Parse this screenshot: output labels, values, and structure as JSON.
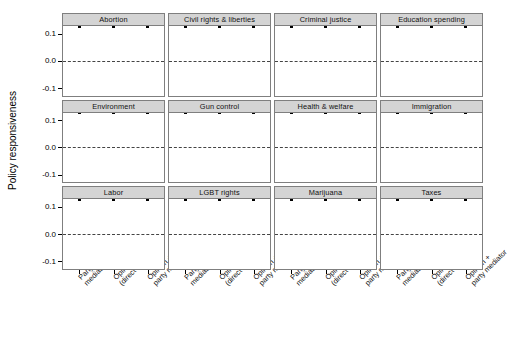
{
  "chart_data": {
    "type": "scatter",
    "title": "",
    "xlabel": "",
    "ylabel": "Policy responsiveness",
    "ylim": [
      -0.13,
      0.13
    ],
    "yticks": [
      "0.1",
      "0.0",
      "-0.1"
    ],
    "ytick_values": [
      0.1,
      0.0,
      -0.1
    ],
    "grid": false,
    "legend": "none",
    "reference_line": 0.0,
    "facet_layout": {
      "rows": 3,
      "cols": 4
    },
    "categories": [
      "Party mediator",
      "Opinion (direct effect)",
      "Opinion + party mediator"
    ],
    "xtick_labels": [
      [
        "Party",
        "mediator"
      ],
      [
        "Opinion",
        "(direct effect)"
      ],
      [
        "Opinion +",
        "party mediator"
      ]
    ],
    "panels": [
      {
        "title": "Abortion",
        "points": [
          {
            "x": "Party mediator",
            "estimate": 0.001,
            "low": 0.0,
            "high": 0.002
          },
          {
            "x": "Opinion (direct effect)",
            "estimate": 0.019,
            "low": 0.01,
            "high": 0.028
          },
          {
            "x": "Opinion + party mediator",
            "estimate": 0.018,
            "low": 0.009,
            "high": 0.027
          }
        ]
      },
      {
        "title": "Civil rights & liberties",
        "points": [
          {
            "x": "Party mediator",
            "estimate": 0.0,
            "low": -0.001,
            "high": 0.001
          },
          {
            "x": "Opinion (direct effect)",
            "estimate": -0.018,
            "low": -0.027,
            "high": -0.009
          },
          {
            "x": "Opinion + party mediator",
            "estimate": -0.018,
            "low": -0.027,
            "high": -0.009
          }
        ]
      },
      {
        "title": "Criminal justice",
        "points": [
          {
            "x": "Party mediator",
            "estimate": 0.0,
            "low": -0.001,
            "high": 0.001
          },
          {
            "x": "Opinion (direct effect)",
            "estimate": 0.0,
            "low": -0.021,
            "high": 0.021
          },
          {
            "x": "Opinion + party mediator",
            "estimate": 0.0,
            "low": -0.02,
            "high": 0.02
          }
        ]
      },
      {
        "title": "Education spending",
        "points": [
          {
            "x": "Party mediator",
            "estimate": 0.002,
            "low": 0.001,
            "high": 0.003
          },
          {
            "x": "Opinion (direct effect)",
            "estimate": -0.005,
            "low": -0.014,
            "high": 0.004
          },
          {
            "x": "Opinion + party mediator",
            "estimate": -0.003,
            "low": -0.012,
            "high": 0.006
          }
        ]
      },
      {
        "title": "Environment",
        "points": [
          {
            "x": "Party mediator",
            "estimate": 0.001,
            "low": 0.0,
            "high": 0.002
          },
          {
            "x": "Opinion (direct effect)",
            "estimate": 0.001,
            "low": -0.013,
            "high": 0.015
          },
          {
            "x": "Opinion + party mediator",
            "estimate": 0.003,
            "low": -0.011,
            "high": 0.017
          }
        ]
      },
      {
        "title": "Gun control",
        "points": [
          {
            "x": "Party mediator",
            "estimate": 0.0,
            "low": -0.001,
            "high": 0.001
          },
          {
            "x": "Opinion (direct effect)",
            "estimate": 0.002,
            "low": -0.003,
            "high": 0.007
          },
          {
            "x": "Opinion + party mediator",
            "estimate": 0.003,
            "low": -0.002,
            "high": 0.008
          }
        ]
      },
      {
        "title": "Health & welfare",
        "points": [
          {
            "x": "Party mediator",
            "estimate": 0.002,
            "low": 0.001,
            "high": 0.003
          },
          {
            "x": "Opinion (direct effect)",
            "estimate": -0.03,
            "low": -0.052,
            "high": 0.006
          },
          {
            "x": "Opinion + party mediator",
            "estimate": -0.029,
            "low": -0.05,
            "high": 0.006
          }
        ]
      },
      {
        "title": "Immigration",
        "points": [
          {
            "x": "Party mediator",
            "estimate": -0.014,
            "low": -0.029,
            "high": 0.004
          },
          {
            "x": "Opinion (direct effect)",
            "estimate": -0.035,
            "low": -0.065,
            "high": 0.007
          },
          {
            "x": "Opinion + party mediator",
            "estimate": -0.055,
            "low": -0.085,
            "high": 0.003
          }
        ]
      },
      {
        "title": "Labor",
        "points": [
          {
            "x": "Party mediator",
            "estimate": 0.0,
            "low": -0.001,
            "high": 0.001
          },
          {
            "x": "Opinion (direct effect)",
            "estimate": 0.002,
            "low": -0.013,
            "high": 0.017
          },
          {
            "x": "Opinion + party mediator",
            "estimate": 0.005,
            "low": -0.011,
            "high": 0.02
          }
        ]
      },
      {
        "title": "LGBT rights",
        "points": [
          {
            "x": "Party mediator",
            "estimate": 0.0,
            "low": -0.001,
            "high": 0.001
          },
          {
            "x": "Opinion (direct effect)",
            "estimate": 0.072,
            "low": 0.064,
            "high": 0.08
          },
          {
            "x": "Opinion + party mediator",
            "estimate": 0.073,
            "low": 0.065,
            "high": 0.081
          }
        ]
      },
      {
        "title": "Marijuana",
        "points": [
          {
            "x": "Party mediator",
            "estimate": 0.0,
            "low": -0.001,
            "high": 0.001
          },
          {
            "x": "Opinion (direct effect)",
            "estimate": 0.055,
            "low": 0.042,
            "high": 0.068
          },
          {
            "x": "Opinion + party mediator",
            "estimate": 0.056,
            "low": 0.044,
            "high": 0.068
          }
        ]
      },
      {
        "title": "Taxes",
        "points": [
          {
            "x": "Party mediator",
            "estimate": 0.0,
            "low": -0.001,
            "high": 0.001
          },
          {
            "x": "Opinion (direct effect)",
            "estimate": 0.002,
            "low": -0.004,
            "high": 0.008
          },
          {
            "x": "Opinion + party mediator",
            "estimate": 0.003,
            "low": -0.003,
            "high": 0.009
          }
        ]
      }
    ]
  },
  "colors": {
    "strip_fill": "#d4d4d4",
    "panel_border": "#7f7f7f",
    "point": "#000000",
    "error_bar": "#8a8a8a",
    "reference_line": "#444444",
    "background": "#ffffff"
  }
}
